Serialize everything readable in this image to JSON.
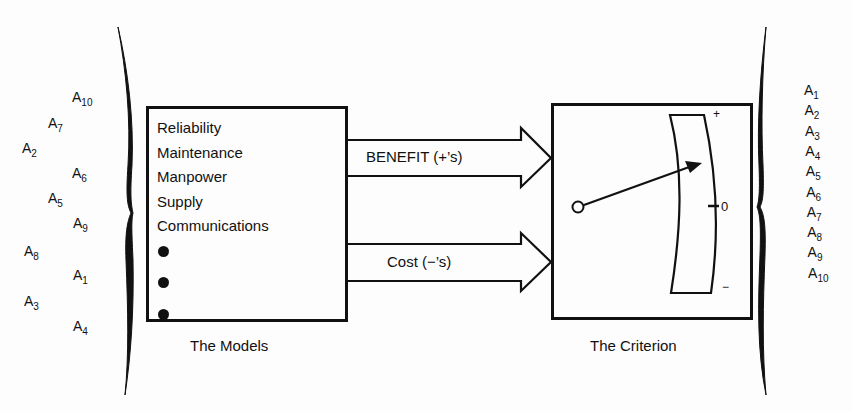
{
  "diagram": {
    "ink_color": "#111111",
    "background_color": "#fdfdfd",
    "left_alternatives": [
      {
        "base": "A",
        "sub": "10",
        "x": 72,
        "y": 90
      },
      {
        "base": "A",
        "sub": "7",
        "x": 48,
        "y": 116
      },
      {
        "base": "A",
        "sub": "2",
        "x": 22,
        "y": 141
      },
      {
        "base": "A",
        "sub": "6",
        "x": 72,
        "y": 166
      },
      {
        "base": "A",
        "sub": "5",
        "x": 48,
        "y": 191
      },
      {
        "base": "A",
        "sub": "9",
        "x": 73,
        "y": 216
      },
      {
        "base": "A",
        "sub": "8",
        "x": 24,
        "y": 244
      },
      {
        "base": "A",
        "sub": "1",
        "x": 73,
        "y": 268
      },
      {
        "base": "A",
        "sub": "3",
        "x": 24,
        "y": 294
      },
      {
        "base": "A",
        "sub": "4",
        "x": 73,
        "y": 319
      }
    ],
    "models_box": {
      "caption": "The Models",
      "items": [
        "Reliability",
        "Maintenance",
        "Manpower",
        "Supply",
        "Communications"
      ],
      "ellipsis_dots": 3
    },
    "arrows": {
      "benefit_label": "BENEFIT (+’s)",
      "cost_label": "Cost (−’s)"
    },
    "criterion_box": {
      "caption": "The Criterion",
      "meter": {
        "plus_label": "+",
        "zero_label": "0",
        "minus_label": "−"
      }
    },
    "right_alternatives": [
      {
        "base": "A",
        "sub": "1"
      },
      {
        "base": "A",
        "sub": "2"
      },
      {
        "base": "A",
        "sub": "3"
      },
      {
        "base": "A",
        "sub": "4"
      },
      {
        "base": "A",
        "sub": "5"
      },
      {
        "base": "A",
        "sub": "6"
      },
      {
        "base": "A",
        "sub": "7"
      },
      {
        "base": "A",
        "sub": "8"
      },
      {
        "base": "A",
        "sub": "9"
      },
      {
        "base": "A",
        "sub": "10"
      }
    ]
  }
}
